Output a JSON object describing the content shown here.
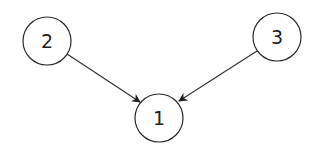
{
  "diagram": {
    "type": "directed-graph",
    "nodes": [
      {
        "id": "1",
        "label": "1",
        "cx": 159,
        "cy": 118,
        "r": 24
      },
      {
        "id": "2",
        "label": "2",
        "cx": 47,
        "cy": 41,
        "r": 24
      },
      {
        "id": "3",
        "label": "3",
        "cx": 277,
        "cy": 37,
        "r": 24
      }
    ],
    "edges": [
      {
        "from": "2",
        "to": "1"
      },
      {
        "from": "3",
        "to": "1"
      }
    ],
    "colors": {
      "stroke": "#2b2b2b",
      "background": "#ffffff"
    }
  }
}
